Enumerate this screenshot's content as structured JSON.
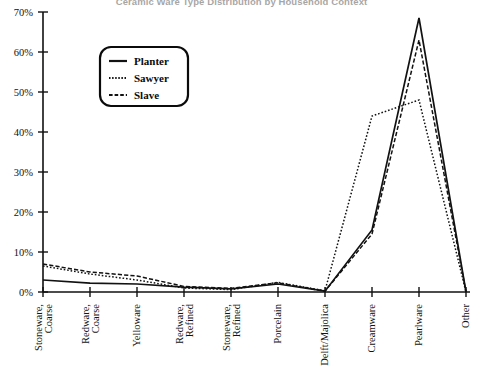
{
  "chart_data": {
    "type": "line",
    "title": "Ceramic Ware Type Distribution by Household Context",
    "xlabel": "",
    "ylabel": "",
    "ylim": [
      0,
      70
    ],
    "ytick_labels": [
      "0%",
      "10%",
      "20%",
      "30%",
      "40%",
      "50%",
      "60%",
      "70%"
    ],
    "ytick_values": [
      0,
      10,
      20,
      30,
      40,
      50,
      60,
      70
    ],
    "grid": false,
    "legend_position": "upper-left-inside",
    "categories": [
      "Stoneware, Coarse",
      "Redware, Coarse",
      "Yelloware",
      "Redware, Refined",
      "Stoneware, Refined",
      "Porcelain",
      "Delft/Majolica",
      "Creamware",
      "Pearlware",
      "Other"
    ],
    "series": [
      {
        "name": "Planter",
        "style": "solid",
        "values": [
          3.0,
          2.2,
          2.0,
          1.2,
          0.8,
          2.0,
          0.2,
          15.5,
          68.5,
          0.0
        ]
      },
      {
        "name": "Sawyer",
        "style": "dotted",
        "values": [
          6.5,
          4.5,
          3.0,
          1.0,
          0.6,
          2.4,
          0.3,
          44.0,
          48.0,
          0.0
        ]
      },
      {
        "name": "Slave",
        "style": "dashed",
        "values": [
          7.0,
          5.0,
          4.0,
          1.4,
          0.9,
          2.3,
          0.2,
          14.5,
          63.0,
          0.0
        ]
      }
    ]
  },
  "legend": {
    "items": [
      {
        "label": "Planter",
        "style": "solid"
      },
      {
        "label": "Sawyer",
        "style": "dotted"
      },
      {
        "label": "Slave",
        "style": "dashed"
      }
    ]
  }
}
